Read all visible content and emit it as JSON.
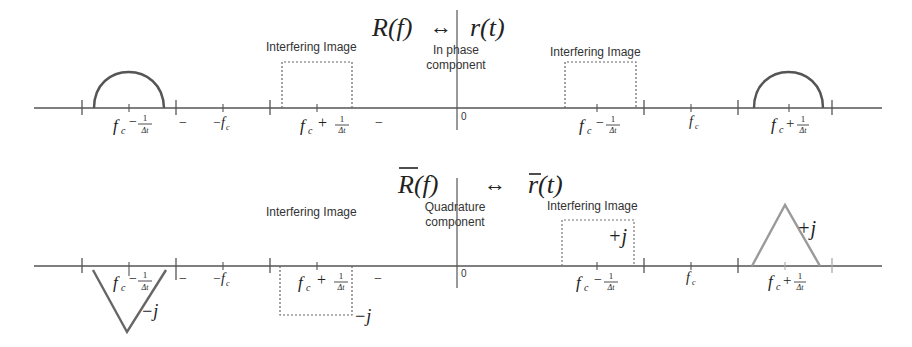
{
  "top_panel": {
    "title": {
      "lhs": "R(f)",
      "arrow": "↔",
      "rhs": "r(t)"
    },
    "center_label_line1": "In phase",
    "center_label_line2": "component",
    "left_image_label": "Interfering Image",
    "right_image_label": "Interfering Image",
    "origin_label": "0",
    "tick_labels": {
      "fc_minus_left": {
        "f": "f",
        "sub": "c",
        "op": "−",
        "num": "1",
        "den": "Δt"
      },
      "dash1": "−",
      "neg_fc": {
        "pre": "−",
        "f": "f",
        "sub": "c"
      },
      "fc_plus_mid": {
        "f": "f",
        "sub": "c",
        "op": "+",
        "num": "1",
        "den": "Δt"
      },
      "dash2": "−",
      "fc_minus_right": {
        "f": "f",
        "sub": "c",
        "op": "−",
        "num": "1",
        "den": "Δt"
      },
      "fc": {
        "f": "f",
        "sub": "c"
      },
      "fc_plus_right": {
        "f": "f",
        "sub": "c",
        "op": "+",
        "num": "1",
        "den": "Δt"
      }
    }
  },
  "bottom_panel": {
    "title": {
      "lhs": "R(f)",
      "arrow": "↔",
      "rhs": "r(t)"
    },
    "center_label_line1": "Quadrature",
    "center_label_line2": "component",
    "left_image_label": "Interfering Image",
    "right_image_label": "Interfering Image",
    "origin_label": "0",
    "left_v_value": "−j",
    "left_box_value": "−j",
    "right_box_value": "+j",
    "right_triangle_value": "+j",
    "tick_labels": {
      "fc_minus_left": {
        "f": "f",
        "sub": "c",
        "op": "−",
        "num": "1",
        "den": "Δt"
      },
      "dash1": "−",
      "neg_fc": {
        "pre": "−",
        "f": "f",
        "sub": "c"
      },
      "fc_plus_mid": {
        "f": "f",
        "sub": "c",
        "op": "+",
        "num": "1",
        "den": "Δt"
      },
      "dash2": "−",
      "fc_minus_right": {
        "f": "f",
        "sub": "c",
        "op": "−",
        "num": "1",
        "den": "Δt"
      },
      "fc": {
        "f": "f",
        "sub": "c"
      },
      "fc_plus_right": {
        "f": "f",
        "sub": "c",
        "op": "+",
        "num": "1",
        "den": "Δt"
      }
    }
  },
  "colors": {
    "axis": "#555555",
    "curve": "#555555",
    "triangle_right": "#9a9a9a",
    "dashed_box": "#666666",
    "text": "#222222"
  }
}
